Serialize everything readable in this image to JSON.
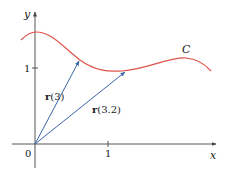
{
  "figure": {
    "axes": {
      "x_label": "x",
      "y_label": "y",
      "origin_label": "0",
      "x_tick_label": "1",
      "y_tick_label": "1"
    },
    "curve": {
      "label": "C",
      "color": "#e0534a"
    },
    "vectors": [
      {
        "label_bold": "r",
        "label_arg": "(3)",
        "color": "#3a66a8"
      },
      {
        "label_bold": "r",
        "label_arg": "(3.2)",
        "color": "#3a66a8"
      }
    ],
    "colors": {
      "axis": "#555555",
      "curve": "#e0534a",
      "vector": "#3a66a8"
    }
  }
}
